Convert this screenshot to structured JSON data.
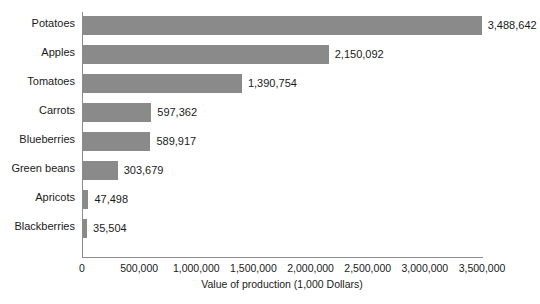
{
  "chart_data": {
    "type": "bar",
    "orientation": "horizontal",
    "title": "",
    "xlabel": "Value of production (1,000 Dollars)",
    "ylabel": "",
    "categories": [
      "Potatoes",
      "Apples",
      "Tomatoes",
      "Carrots",
      "Blueberries",
      "Green beans",
      "Apricots",
      "Blackberries"
    ],
    "values": [
      3488642,
      2150092,
      1390754,
      597362,
      589917,
      303679,
      47498,
      35504
    ],
    "value_labels": [
      "3,488,642",
      "2,150,092",
      "1,390,754",
      "597,362",
      "589,917",
      "303,679",
      "47,498",
      "35,504"
    ],
    "xlim": [
      0,
      3500000
    ],
    "xticks": [
      0,
      500000,
      1000000,
      1500000,
      2000000,
      2500000,
      3000000,
      3500000
    ],
    "xtick_labels": [
      "0",
      "500,000",
      "1,000,000",
      "1,500,000",
      "2,000,000",
      "2,500,000",
      "3,000,000",
      "3,500,000"
    ],
    "grid": false,
    "legend": false,
    "bar_color": "#8a8a8a",
    "axis_color": "#8c8c8c",
    "text_color": "#1a1a1a"
  }
}
